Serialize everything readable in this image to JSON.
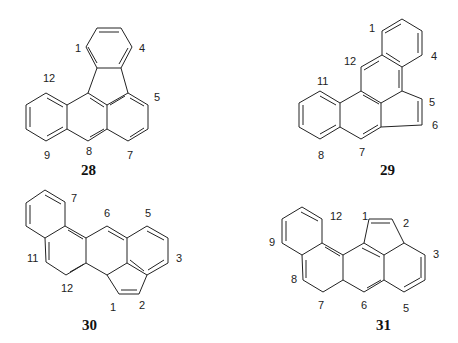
{
  "compounds": [
    {
      "id": "28",
      "labels": [
        "1",
        "4",
        "12",
        "5",
        "9",
        "8",
        "7"
      ]
    },
    {
      "id": "29",
      "labels": [
        "1",
        "12",
        "4",
        "11",
        "5",
        "6",
        "8",
        "7"
      ]
    },
    {
      "id": "30",
      "labels": [
        "7",
        "6",
        "5",
        "11",
        "3",
        "12",
        "1",
        "2"
      ]
    },
    {
      "id": "31",
      "labels": [
        "12",
        "1",
        "2",
        "9",
        "3",
        "8",
        "7",
        "6",
        "5"
      ]
    }
  ]
}
